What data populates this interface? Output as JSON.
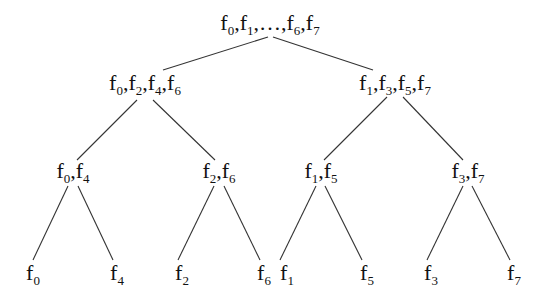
{
  "tree": {
    "root": {
      "label_parts": [
        [
          "f",
          "0"
        ],
        [
          "f",
          "1"
        ],
        [
          "…",
          ""
        ],
        [
          "f",
          "6"
        ],
        [
          "f",
          "7"
        ]
      ],
      "x": 270,
      "y": 12
    },
    "level1": [
      {
        "label_parts": [
          [
            "f",
            "0"
          ],
          [
            "f",
            "2"
          ],
          [
            "f",
            "4"
          ],
          [
            "f",
            "6"
          ]
        ],
        "x": 145,
        "y": 72
      },
      {
        "label_parts": [
          [
            "f",
            "1"
          ],
          [
            "f",
            "3"
          ],
          [
            "f",
            "5"
          ],
          [
            "f",
            "7"
          ]
        ],
        "x": 395,
        "y": 72
      }
    ],
    "level2": [
      {
        "label_parts": [
          [
            "f",
            "0"
          ],
          [
            "f",
            "4"
          ]
        ],
        "x": 73,
        "y": 160
      },
      {
        "label_parts": [
          [
            "f",
            "2"
          ],
          [
            "f",
            "6"
          ]
        ],
        "x": 219,
        "y": 160
      },
      {
        "label_parts": [
          [
            "f",
            "1"
          ],
          [
            "f",
            "5"
          ]
        ],
        "x": 321,
        "y": 160
      },
      {
        "label_parts": [
          [
            "f",
            "3"
          ],
          [
            "f",
            "7"
          ]
        ],
        "x": 468,
        "y": 160
      }
    ],
    "leaves": [
      {
        "label_parts": [
          [
            "f",
            "0"
          ]
        ],
        "x": 33,
        "y": 262
      },
      {
        "label_parts": [
          [
            "f",
            "4"
          ]
        ],
        "x": 117,
        "y": 262
      },
      {
        "label_parts": [
          [
            "f",
            "2"
          ]
        ],
        "x": 182,
        "y": 262
      },
      {
        "label_parts": [
          [
            "f",
            "6"
          ]
        ],
        "x": 264,
        "y": 262
      },
      {
        "label_parts": [
          [
            "f",
            "1"
          ]
        ],
        "x": 287,
        "y": 262
      },
      {
        "label_parts": [
          [
            "f",
            "5"
          ]
        ],
        "x": 367,
        "y": 262
      },
      {
        "label_parts": [
          [
            "f",
            "3"
          ]
        ],
        "x": 431,
        "y": 262
      },
      {
        "label_parts": [
          [
            "f",
            "7"
          ]
        ],
        "x": 514,
        "y": 262
      }
    ],
    "labels": {
      "root": "f0,f1,…,f6,f7",
      "level1": [
        "f0,f2,f4,f6",
        "f1,f3,f5,f7"
      ],
      "level2": [
        "f0,f4",
        "f2,f6",
        "f1,f5",
        "f3,f7"
      ],
      "leaves": [
        "f0",
        "f4",
        "f2",
        "f6",
        "f1",
        "f5",
        "f3",
        "f7"
      ]
    },
    "edges": [
      [
        268,
        37,
        163,
        70
      ],
      [
        273,
        37,
        373,
        70
      ],
      [
        137,
        100,
        77,
        160
      ],
      [
        153,
        100,
        215,
        160
      ],
      [
        387,
        97,
        324,
        160
      ],
      [
        403,
        97,
        463,
        160
      ],
      [
        68,
        186,
        33,
        260
      ],
      [
        78,
        186,
        113,
        260
      ],
      [
        214,
        186,
        178,
        260
      ],
      [
        224,
        186,
        260,
        260
      ],
      [
        316,
        186,
        280,
        260
      ],
      [
        325,
        186,
        362,
        260
      ],
      [
        463,
        186,
        427,
        260
      ],
      [
        472,
        186,
        510,
        260
      ]
    ],
    "line_color": "#333333"
  }
}
